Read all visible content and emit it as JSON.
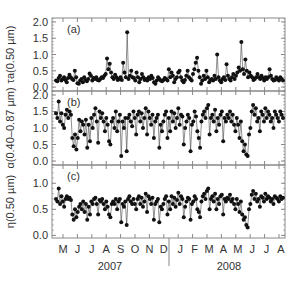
{
  "chart_data": {
    "type": "line",
    "title": "",
    "xlabel": "",
    "x_months": [
      "M",
      "J",
      "J",
      "A",
      "S",
      "O",
      "N",
      "D",
      "J",
      "F",
      "M",
      "A",
      "M",
      "J",
      "J",
      "A"
    ],
    "x_years": [
      "2007",
      "2008"
    ],
    "panels": [
      {
        "id": "a",
        "label": "(a)",
        "ylabel": "τa(0.50 µm)",
        "ylim": [
          -0.12,
          2.12
        ],
        "yticks": [
          "0.0",
          "0.5",
          "1.0",
          "1.5",
          "2.0"
        ],
        "ytick_values": [
          0.0,
          0.5,
          1.0,
          1.5,
          2.0
        ],
        "series": [
          0.2,
          0.18,
          0.28,
          0.35,
          0.2,
          0.25,
          0.3,
          0.22,
          0.15,
          0.28,
          0.38,
          0.3,
          0.25,
          0.22,
          0.5,
          0.3,
          0.12,
          0.1,
          0.2,
          0.25,
          0.15,
          0.3,
          0.22,
          0.18,
          0.25,
          0.42,
          0.35,
          0.2,
          0.28,
          0.25,
          0.3,
          0.22,
          0.2,
          0.25,
          0.3,
          0.28,
          0.35,
          0.4,
          0.88,
          0.55,
          0.72,
          0.45,
          0.3,
          0.25,
          0.38,
          0.3,
          0.22,
          0.25,
          0.3,
          0.22,
          0.75,
          0.45,
          0.3,
          1.68,
          0.25,
          0.35,
          0.5,
          0.3,
          0.28,
          0.2,
          0.45,
          0.3,
          0.15,
          0.25,
          0.4,
          0.3,
          0.22,
          0.25,
          0.2,
          0.3,
          0.25,
          0.35,
          0.28,
          0.15,
          0.1,
          0.2,
          0.3,
          0.25,
          0.2,
          0.18,
          0.22,
          0.28,
          0.25,
          0.2,
          0.55,
          0.3,
          0.45,
          0.35,
          0.15,
          0.25,
          0.3,
          0.45,
          0.5,
          0.3,
          0.2,
          0.15,
          0.22,
          0.35,
          0.5,
          0.3,
          0.25,
          0.2,
          0.4,
          0.55,
          0.75,
          0.9,
          0.5,
          0.3,
          0.1,
          0.2,
          0.35,
          0.25,
          0.5,
          0.3,
          0.15,
          0.22,
          0.25,
          0.2,
          0.35,
          0.25,
          1.0,
          0.3,
          0.2,
          0.15,
          0.25,
          0.3,
          0.22,
          0.7,
          0.35,
          0.25,
          0.2,
          0.3,
          0.4,
          0.25,
          0.35,
          0.45,
          0.6,
          0.5,
          1.38,
          0.55,
          0.4,
          0.85,
          0.5,
          0.3,
          0.45,
          0.35,
          0.3,
          0.22,
          0.25,
          0.3,
          0.4,
          0.3,
          0.25,
          0.35,
          0.28,
          0.2,
          0.3,
          0.25,
          0.3,
          0.55,
          0.35,
          0.25,
          0.2,
          0.22,
          0.3,
          0.25,
          0.2,
          0.3,
          0.25,
          0.2
        ]
      },
      {
        "id": "b",
        "label": "(b)",
        "ylabel": "α(0.40–0.87 µm)",
        "ylim": [
          -0.12,
          2.12
        ],
        "yticks": [
          "0.0",
          "0.5",
          "1.0",
          "1.5",
          "2.0"
        ],
        "ytick_values": [
          0.0,
          0.5,
          1.0,
          1.5,
          2.0
        ],
        "series": [
          1.45,
          1.3,
          1.8,
          1.2,
          1.45,
          1.1,
          1.0,
          1.4,
          1.55,
          1.3,
          1.5,
          1.4,
          0.7,
          0.45,
          0.8,
          0.35,
          0.7,
          1.25,
          0.9,
          1.2,
          1.1,
          0.8,
          1.25,
          0.4,
          1.1,
          0.6,
          1.3,
          1.0,
          1.4,
          1.6,
          1.2,
          0.55,
          1.5,
          1.3,
          1.45,
          1.2,
          0.9,
          1.3,
          1.1,
          0.6,
          0.5,
          1.2,
          1.3,
          1.0,
          1.5,
          0.9,
          1.2,
          1.4,
          0.15,
          1.2,
          1.0,
          1.3,
          0.3,
          1.3,
          1.4,
          1.2,
          1.05,
          1.5,
          1.3,
          0.8,
          1.4,
          1.5,
          1.2,
          1.45,
          1.0,
          1.3,
          1.6,
          0.8,
          1.5,
          1.3,
          1.1,
          1.4,
          0.7,
          1.2,
          1.3,
          1.4,
          0.4,
          1.1,
          0.9,
          1.2,
          1.4,
          1.5,
          0.7,
          1.3,
          0.9,
          1.5,
          1.2,
          1.45,
          1.0,
          1.3,
          1.6,
          1.1,
          1.4,
          1.35,
          0.5,
          1.0,
          1.2,
          1.4,
          1.3,
          0.3,
          1.1,
          1.2,
          1.5,
          1.35,
          0.9,
          0.7,
          0.4,
          1.2,
          1.4,
          1.5,
          1.3,
          1.6,
          1.7,
          0.8,
          1.3,
          1.4,
          1.2,
          1.55,
          0.9,
          1.3,
          1.1,
          1.4,
          1.5,
          0.6,
          1.3,
          1.2,
          1.4,
          1.3,
          1.5,
          1.2,
          1.4,
          1.1,
          0.9,
          1.3,
          1.1,
          0.7,
          1.2,
          0.6,
          0.3,
          0.5,
          0.2,
          0.15,
          0.8,
          1.0,
          1.5,
          1.7,
          1.4,
          1.6,
          1.2,
          1.3,
          0.9,
          1.5,
          1.4,
          1.2,
          1.6,
          1.3,
          1.5,
          1.4,
          1.2,
          1.3,
          1.0,
          1.5,
          1.4,
          1.3,
          1.2,
          1.5,
          1.4,
          1.3
        ]
      },
      {
        "id": "c",
        "label": "(c)",
        "ylabel": "η(0.50 µm)",
        "ylim": [
          -0.05,
          1.35
        ],
        "yticks": [
          "0.0",
          "0.5",
          "1.0"
        ],
        "ytick_values": [
          0.0,
          0.5,
          1.0
        ],
        "series": [
          0.7,
          0.65,
          0.9,
          0.6,
          0.75,
          0.65,
          0.55,
          0.7,
          0.75,
          0.7,
          0.72,
          0.68,
          0.4,
          0.3,
          0.5,
          0.35,
          0.45,
          0.55,
          0.6,
          0.5,
          0.65,
          0.45,
          0.6,
          0.3,
          0.55,
          0.4,
          0.65,
          0.6,
          0.7,
          0.72,
          0.6,
          0.4,
          0.68,
          0.65,
          0.7,
          0.6,
          0.5,
          0.65,
          0.55,
          0.4,
          0.35,
          0.6,
          0.65,
          0.6,
          0.7,
          0.5,
          0.65,
          0.7,
          0.25,
          0.6,
          0.55,
          0.65,
          0.2,
          0.7,
          0.75,
          0.65,
          0.6,
          0.7,
          0.6,
          0.5,
          0.7,
          0.75,
          0.6,
          0.72,
          0.55,
          0.65,
          0.8,
          0.45,
          0.75,
          0.7,
          0.6,
          0.72,
          0.3,
          0.6,
          0.65,
          0.7,
          0.25,
          0.55,
          0.5,
          0.6,
          0.7,
          0.75,
          0.4,
          0.65,
          0.5,
          0.75,
          0.6,
          0.72,
          0.55,
          0.68,
          0.82,
          0.6,
          0.75,
          0.7,
          0.35,
          0.55,
          0.65,
          0.72,
          0.7,
          0.3,
          0.6,
          0.65,
          0.75,
          0.7,
          0.5,
          0.45,
          0.35,
          0.65,
          0.75,
          0.8,
          0.7,
          0.85,
          0.9,
          0.5,
          0.7,
          0.75,
          0.65,
          0.8,
          0.5,
          0.7,
          0.6,
          0.75,
          0.78,
          0.4,
          0.7,
          0.65,
          0.72,
          0.7,
          0.78,
          0.65,
          0.7,
          0.6,
          0.5,
          0.7,
          0.6,
          0.45,
          0.65,
          0.4,
          0.3,
          0.35,
          0.2,
          0.15,
          0.5,
          0.6,
          0.78,
          0.85,
          0.7,
          0.8,
          0.65,
          0.7,
          0.55,
          0.75,
          0.72,
          0.65,
          0.8,
          0.7,
          0.75,
          0.72,
          0.65,
          0.7,
          0.6,
          0.75,
          0.72,
          0.7,
          0.65,
          0.75,
          0.7,
          0.72
        ]
      }
    ]
  },
  "colors": {
    "axis": "#888888",
    "data": "#111111",
    "text": "#333333"
  }
}
